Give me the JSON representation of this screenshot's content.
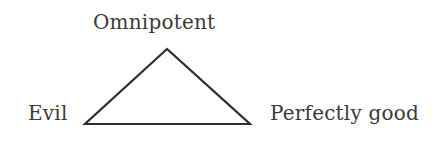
{
  "diagram": {
    "type": "triangle",
    "vertices": {
      "top": {
        "label": "Omnipotent"
      },
      "bottom_left": {
        "label": "Evil"
      },
      "bottom_right": {
        "label": "Perfectly good"
      }
    },
    "colors": {
      "line": "#2e2e2e",
      "text": "#3a3a3a",
      "background": "#ffffff"
    }
  }
}
